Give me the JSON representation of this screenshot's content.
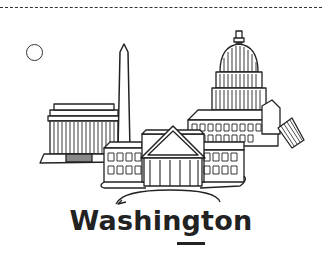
{
  "card": {
    "title": "Washington",
    "illustration": "washington-dc-landmarks-icon",
    "landmarks": [
      "Lincoln Memorial",
      "Washington Monument",
      "U.S. Capitol",
      "White House"
    ],
    "answer_blank": "",
    "colors": {
      "ink": "#222222",
      "background": "#ffffff"
    }
  }
}
